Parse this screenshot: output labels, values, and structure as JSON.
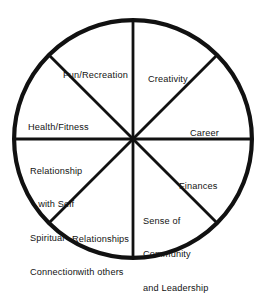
{
  "figure": {
    "name": "wheel-of-life",
    "shape": "circle-divided-into-eight-equal-sectors",
    "background_color": "#ffffff",
    "stroke_color": "#111111",
    "text_color": "#131313",
    "center_x": 133,
    "center_y": 139,
    "radius": 121,
    "outline_width": 4.2,
    "spoke_width": 2.8,
    "sector_count": 8
  },
  "chart_data": {
    "type": "pie",
    "title": "",
    "categories": [
      "Creativity",
      "Career",
      "Finances",
      "Sense of Community and Leadership",
      "Relationships with others",
      "Relationship with Self Spiritual Connection",
      "Health/Fitness",
      "Fun/Recreation"
    ],
    "values": [
      12.5,
      12.5,
      12.5,
      12.5,
      12.5,
      12.5,
      12.5,
      12.5
    ],
    "legend": "none",
    "grid": false,
    "xlabel": "",
    "ylabel": ""
  },
  "segments": [
    {
      "id": "creativity",
      "label": "Creativity",
      "lines": [
        "Creativity"
      ],
      "start_angle_deg": 270,
      "end_angle_deg": 315
    },
    {
      "id": "career",
      "label": "Career",
      "lines": [
        "Career"
      ],
      "start_angle_deg": 315,
      "end_angle_deg": 360
    },
    {
      "id": "finances",
      "label": "Finances",
      "lines": [
        "Finances"
      ],
      "start_angle_deg": 0,
      "end_angle_deg": 45
    },
    {
      "id": "community",
      "label": "Sense of Community and Leadership",
      "lines": [
        "Sense of",
        "Community",
        "and Leadership"
      ],
      "start_angle_deg": 45,
      "end_angle_deg": 90
    },
    {
      "id": "relationships-others",
      "label": "Relationships with others",
      "lines": [
        "Relationships",
        "with others"
      ],
      "start_angle_deg": 90,
      "end_angle_deg": 135
    },
    {
      "id": "relationship-self",
      "label": "Relationship with Self Spiritual Connection",
      "lines": [
        "Relationship",
        "with Self",
        "Spiritual",
        "Connection"
      ],
      "start_angle_deg": 135,
      "end_angle_deg": 180
    },
    {
      "id": "health-fitness",
      "label": "Health/Fitness",
      "lines": [
        "Health/Fitness"
      ],
      "start_angle_deg": 180,
      "end_angle_deg": 225
    },
    {
      "id": "fun-recreation",
      "label": "Fun/Recreation",
      "lines": [
        "Fun/Recreation"
      ],
      "start_angle_deg": 225,
      "end_angle_deg": 270
    }
  ],
  "labels": {
    "fun_recreation": "Fun/Recreation",
    "creativity": "Creativity",
    "career": "Career",
    "health_fitness": "Health/Fitness",
    "finances": "Finances",
    "relationship_self_l1": "Relationship",
    "relationship_self_l2": "with Self",
    "relationship_self_l3": "Spiritual",
    "relationship_self_l4": "Connection",
    "community_l1": "Sense of",
    "community_l2": "Community",
    "community_l3": "and Leadership",
    "relationships_others_l1": "Relationships",
    "relationships_others_l2": "with others"
  }
}
